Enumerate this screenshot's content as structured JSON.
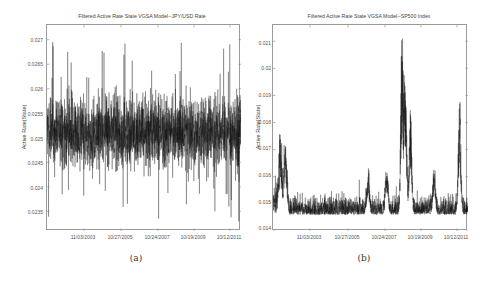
{
  "figure": {
    "panels": [
      {
        "caption": "(a)",
        "title": "Filtered Active Rate State VGSA Model--JPY/USD Rate",
        "ylabel": "Active Rate(State)",
        "yticks": [
          "0.027",
          "0.0265",
          "0.026",
          "0.0255",
          "0.025",
          "0.0245",
          "0.024",
          "0.0235"
        ],
        "xticks": [
          "11/03/2003",
          "10/27/2005",
          "10/24/2007",
          "10/19/2009",
          "10/12/2011"
        ]
      },
      {
        "caption": "(b)",
        "title": "Filtered Active Rate State VGSA Model--SP500 Index",
        "ylabel": "Active Rate(State)",
        "yticks": [
          "0.021",
          "0.02",
          "0.019",
          "0.018",
          "0.017",
          "0.016",
          "0.015",
          "0.014"
        ],
        "xticks": [
          "11/03/2003",
          "10/27/2005",
          "10/24/2007",
          "10/19/2009",
          "10/12/2011"
        ]
      }
    ]
  },
  "chart_data": [
    {
      "type": "line",
      "title": "Filtered Active Rate State VGSA Model--JPY/USD Rate",
      "xlabel": "",
      "ylabel": "Active Rate(State)",
      "x_tick_labels": [
        "11/03/2003",
        "10/27/2005",
        "10/24/2007",
        "10/19/2009",
        "10/12/2011"
      ],
      "y_tick_values": [
        0.0235,
        0.024,
        0.0245,
        0.025,
        0.0255,
        0.026,
        0.0265,
        0.027
      ],
      "ylim": [
        0.0231,
        0.0273
      ],
      "grid": false,
      "legend": null,
      "series": [
        {
          "name": "Filtered active rate (JPY/USD)",
          "description": "Dense stationary noisy series centered near 0.0251, bulk range ~0.0243-0.0258, occasional spikes to ~0.0270 and dips to ~0.0233",
          "mean": 0.0251,
          "typical_low": 0.0243,
          "typical_high": 0.0258,
          "max": 0.0271,
          "min": 0.0232,
          "sample_x": [
            "2002",
            "11/03/2003",
            "10/27/2005",
            "10/24/2007",
            "10/19/2009",
            "10/12/2011"
          ],
          "sample_values": [
            0.0251,
            0.0252,
            0.025,
            0.0251,
            0.0252,
            0.0251
          ]
        }
      ]
    },
    {
      "type": "line",
      "title": "Filtered Active Rate State VGSA Model--SP500 Index",
      "xlabel": "",
      "ylabel": "Active Rate(State)",
      "x_tick_labels": [
        "11/03/2003",
        "10/27/2005",
        "10/24/2007",
        "10/19/2009",
        "10/12/2011"
      ],
      "y_tick_values": [
        0.014,
        0.015,
        0.016,
        0.017,
        0.018,
        0.019,
        0.02,
        0.021
      ],
      "ylim": [
        0.014,
        0.0216
      ],
      "grid": false,
      "legend": null,
      "series": [
        {
          "name": "Filtered active rate (SP500)",
          "description": "Baseline ~0.0148 with noise band 0.0143-0.0153; early cluster of spikes near 2002-2003 up to ~0.0172; large spike during late 2008 crisis up to ~0.0216 (secondary ~0.0205, ~0.0186); spikes ~0.0164 in 2010; late spike ~0.0189 in 2011",
          "baseline": 0.0148,
          "spikes": [
            {
              "date_approx": "2002-10",
              "value": 0.0172
            },
            {
              "date_approx": "2003-01",
              "value": 0.017
            },
            {
              "date_approx": "2007-02",
              "value": 0.0162
            },
            {
              "date_approx": "2008-01",
              "value": 0.0165
            },
            {
              "date_approx": "2008-10",
              "value": 0.0216
            },
            {
              "date_approx": "2008-12",
              "value": 0.0205
            },
            {
              "date_approx": "2009-03",
              "value": 0.0186
            },
            {
              "date_approx": "2010-05",
              "value": 0.0164
            },
            {
              "date_approx": "2011-08",
              "value": 0.0189
            }
          ],
          "sample_x": [
            "2002",
            "11/03/2003",
            "10/27/2005",
            "10/24/2007",
            "10/19/2009",
            "10/12/2011"
          ],
          "sample_values": [
            0.015,
            0.0149,
            0.0147,
            0.0149,
            0.0151,
            0.015
          ]
        }
      ]
    }
  ]
}
